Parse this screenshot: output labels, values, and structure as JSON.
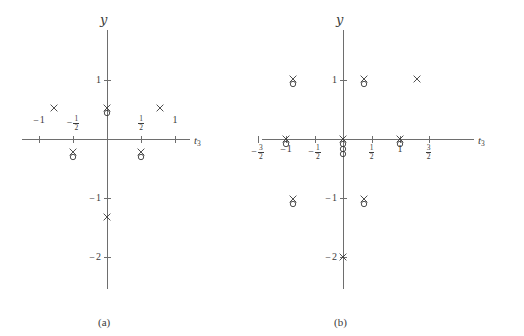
{
  "figure": {
    "type": "pole-zero-plot-pair",
    "background": "#ffffff",
    "ink_color": "#3a3a3a",
    "axis_color": "#6e6e6e",
    "marker_legend": {
      "cross": "pole (x)",
      "circle": "zero (o)"
    }
  },
  "panels": [
    {
      "id": "a",
      "caption": "(a)",
      "xaxis_label": "t",
      "xaxis_label_sub": "3",
      "yaxis_label": "y",
      "xticks": [
        {
          "value": -1,
          "label_minus": "−",
          "label": "1",
          "is_fraction": false
        },
        {
          "value": -0.5,
          "label_minus": "−",
          "num": "1",
          "den": "2",
          "is_fraction": true
        },
        {
          "value": 0.5,
          "label_minus": "",
          "num": "1",
          "den": "2",
          "is_fraction": true
        },
        {
          "value": 1,
          "label_minus": "",
          "label": "1",
          "is_fraction": false
        }
      ],
      "yticks": [
        {
          "value": 1,
          "label_minus": "",
          "label": "1"
        },
        {
          "value": -1,
          "label_minus": "−",
          "label": "1"
        },
        {
          "value": -2,
          "label_minus": "−",
          "label": "2"
        }
      ],
      "markers": [
        {
          "x": -0.78,
          "y": 0.52,
          "glyphs": [
            "x"
          ]
        },
        {
          "x": 0.78,
          "y": 0.52,
          "glyphs": [
            "x"
          ]
        },
        {
          "x": 0.0,
          "y": 0.52,
          "glyphs": [
            "x",
            "o"
          ]
        },
        {
          "x": -0.5,
          "y": -0.22,
          "glyphs": [
            "x",
            "o"
          ]
        },
        {
          "x": 0.5,
          "y": -0.22,
          "glyphs": [
            "x",
            "o"
          ]
        },
        {
          "x": 0.0,
          "y": -1.33,
          "glyphs": [
            "x"
          ]
        }
      ]
    },
    {
      "id": "b",
      "caption": "(b)",
      "xaxis_label": "t",
      "xaxis_label_sub": "3",
      "yaxis_label": "y",
      "xticks": [
        {
          "value": -1.5,
          "label_minus": "−",
          "num": "3",
          "den": "2",
          "is_fraction": true
        },
        {
          "value": -1,
          "label_minus": "−",
          "label": "1",
          "is_fraction": false
        },
        {
          "value": -0.5,
          "label_minus": "−",
          "num": "1",
          "den": "2",
          "is_fraction": true
        },
        {
          "value": 0.5,
          "label_minus": "",
          "num": "1",
          "den": "2",
          "is_fraction": true
        },
        {
          "value": 1,
          "label_minus": "",
          "label": "1",
          "is_fraction": false
        },
        {
          "value": 1.5,
          "label_minus": "",
          "num": "3",
          "den": "2",
          "is_fraction": true
        }
      ],
      "yticks": [
        {
          "value": 1,
          "label_minus": "",
          "label": "1"
        },
        {
          "value": -1,
          "label_minus": "−",
          "label": "1"
        },
        {
          "value": -2,
          "label_minus": "−",
          "label": "2"
        }
      ],
      "markers": [
        {
          "x": -0.88,
          "y": 1.02,
          "glyphs": [
            "x",
            "o"
          ]
        },
        {
          "x": 0.36,
          "y": 1.02,
          "glyphs": [
            "x",
            "o"
          ]
        },
        {
          "x": 1.3,
          "y": 1.02,
          "glyphs": [
            "x"
          ]
        },
        {
          "x": -1.0,
          "y": 0.0,
          "glyphs": [
            "x",
            "o"
          ]
        },
        {
          "x": 0.0,
          "y": 0.0,
          "glyphs": [
            "x",
            "o",
            "o",
            "o"
          ]
        },
        {
          "x": 1.0,
          "y": 0.0,
          "glyphs": [
            "x",
            "o"
          ]
        },
        {
          "x": -0.88,
          "y": -1.02,
          "glyphs": [
            "x",
            "o"
          ]
        },
        {
          "x": 0.36,
          "y": -1.02,
          "glyphs": [
            "x",
            "o"
          ]
        },
        {
          "x": 0.0,
          "y": -2.0,
          "glyphs": [
            "x"
          ]
        }
      ]
    }
  ],
  "chart_data": {
    "type": "scatter",
    "title": "",
    "xlabel": "t3",
    "ylabel": "y",
    "grid": false,
    "legend": "none",
    "subplots": [
      {
        "name": "(a)",
        "xlim": [
          -1.35,
          1.35
        ],
        "ylim": [
          -2.45,
          1.45
        ],
        "xtick_values": [
          -1,
          -0.5,
          0.5,
          1
        ],
        "xtick_labels": [
          "−1",
          "−1/2",
          "1/2",
          "1"
        ],
        "ytick_values": [
          1,
          -1,
          -2
        ],
        "ytick_labels": [
          "1",
          "−1",
          "−2"
        ],
        "series": [
          {
            "name": "poles (x)",
            "points": [
              [
                -0.78,
                0.52
              ],
              [
                0.78,
                0.52
              ],
              [
                0.0,
                0.52
              ],
              [
                -0.5,
                -0.22
              ],
              [
                0.5,
                -0.22
              ],
              [
                0.0,
                -1.33
              ]
            ]
          },
          {
            "name": "zeros (o)",
            "points": [
              [
                0.0,
                0.45
              ],
              [
                -0.5,
                -0.29
              ],
              [
                0.5,
                -0.29
              ]
            ]
          }
        ]
      },
      {
        "name": "(b)",
        "xlim": [
          -1.75,
          1.75
        ],
        "ylim": [
          -2.45,
          1.45
        ],
        "xtick_values": [
          -1.5,
          -1,
          -0.5,
          0.5,
          1,
          1.5
        ],
        "xtick_labels": [
          "−3/2",
          "−1",
          "−1/2",
          "1/2",
          "1",
          "3/2"
        ],
        "ytick_values": [
          1,
          -1,
          -2
        ],
        "ytick_labels": [
          "1",
          "−1",
          "−2"
        ],
        "series": [
          {
            "name": "poles (x)",
            "points": [
              [
                -0.88,
                1.02
              ],
              [
                0.36,
                1.02
              ],
              [
                1.3,
                1.02
              ],
              [
                -1.0,
                0.0
              ],
              [
                0.0,
                0.0
              ],
              [
                1.0,
                0.0
              ],
              [
                -0.88,
                -1.02
              ],
              [
                0.36,
                -1.02
              ],
              [
                0.0,
                -2.0
              ]
            ]
          },
          {
            "name": "zeros (o)",
            "points": [
              [
                -0.88,
                0.95
              ],
              [
                0.36,
                0.95
              ],
              [
                -1.0,
                -0.07
              ],
              [
                0.0,
                -0.07
              ],
              [
                0.0,
                -0.13
              ],
              [
                0.0,
                -0.19
              ],
              [
                1.0,
                -0.07
              ],
              [
                -0.88,
                -1.09
              ],
              [
                0.36,
                -1.09
              ]
            ]
          }
        ]
      }
    ]
  }
}
